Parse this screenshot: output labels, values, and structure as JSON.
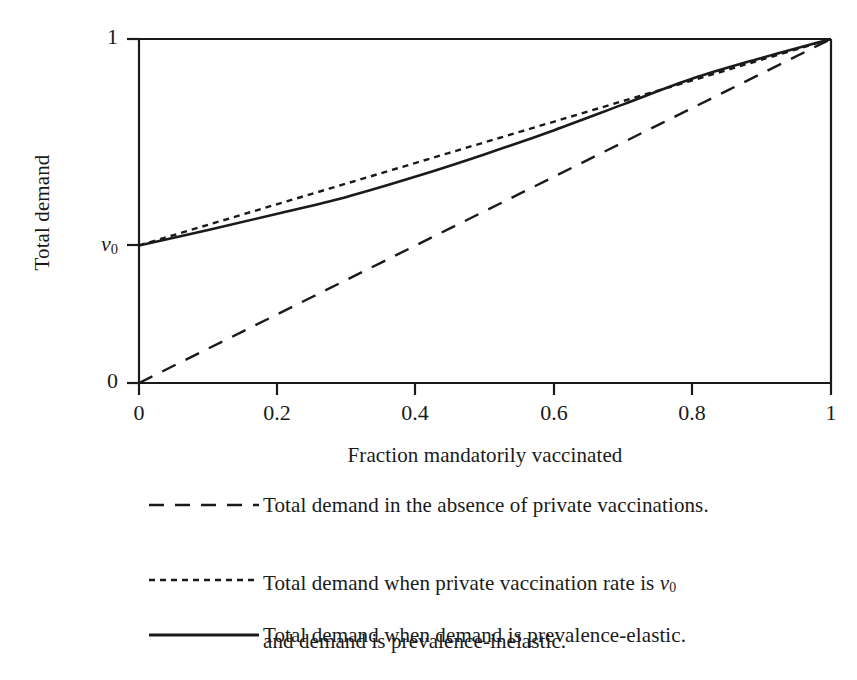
{
  "chart_data": {
    "type": "line",
    "title": "",
    "xlabel": "Fraction mandatorily vaccinated",
    "ylabel": "Total demand",
    "xlim": [
      0,
      1
    ],
    "ylim": [
      0,
      1
    ],
    "grid": false,
    "xticks": [
      0,
      0.2,
      0.4,
      0.6,
      0.8,
      1
    ],
    "xticklabels": [
      "0",
      "0.2",
      "0.4",
      "0.6",
      "0.8",
      "1"
    ],
    "yticks": [
      0,
      0.4,
      1
    ],
    "yticklabels": [
      "0",
      "v0",
      "1"
    ],
    "ytick_label_special": {
      "v0_symbol": "v",
      "v0_subscript": "0",
      "v0_value": 0.4
    },
    "legend_position": "below-axes",
    "series": [
      {
        "name": "absence",
        "label": "Total demand in the absence of private vaccinations.",
        "linestyle": "dashed",
        "color": "#1a1a1a",
        "x": [
          0,
          0.1,
          0.2,
          0.3,
          0.4,
          0.5,
          0.6,
          0.7,
          0.8,
          0.9,
          1
        ],
        "y": [
          0,
          0.1,
          0.2,
          0.3,
          0.4,
          0.5,
          0.6,
          0.7,
          0.8,
          0.9,
          1
        ]
      },
      {
        "name": "inelastic",
        "label": "Total demand when private vaccination rate is v0\nand demand is prevalence-inelastic.",
        "label_line1_pre": "Total demand when private vaccination rate is ",
        "label_line1_symbol": "v",
        "label_line1_subscript": "0",
        "label_line2": "and demand is prevalence-inelastic.",
        "linestyle": "dotted",
        "color": "#1a1a1a",
        "x": [
          0,
          0.1,
          0.2,
          0.3,
          0.4,
          0.5,
          0.6,
          0.7,
          0.8,
          0.9,
          1
        ],
        "y": [
          0.4,
          0.46,
          0.52,
          0.58,
          0.64,
          0.7,
          0.76,
          0.82,
          0.88,
          0.94,
          1
        ]
      },
      {
        "name": "elastic",
        "label": "Total demand when demand is prevalence-elastic.",
        "linestyle": "solid",
        "color": "#1a1a1a",
        "x": [
          0,
          0.1,
          0.2,
          0.3,
          0.4,
          0.5,
          0.6,
          0.7,
          0.8,
          0.9,
          1
        ],
        "y": [
          0.4,
          0.445,
          0.492,
          0.541,
          0.6,
          0.665,
          0.735,
          0.81,
          0.885,
          0.945,
          1
        ]
      }
    ]
  },
  "axes": {
    "ylabel": "Total demand",
    "xlabel": "Fraction mandatorily vaccinated",
    "ytick_top": "1",
    "ytick_bottom": "0",
    "xtick_0": "0",
    "xtick_1": "0.2",
    "xtick_2": "0.4",
    "xtick_3": "0.6",
    "xtick_4": "0.8",
    "xtick_5": "1"
  },
  "legend": {
    "entries": [
      {
        "style": "dashed",
        "text": "Total demand in the absence of private vaccinations."
      },
      {
        "style": "dotted",
        "text_line1_pre": "Total demand when private vaccination rate is ",
        "text_line1_sym": "v",
        "text_line1_sub": "0",
        "text_line2": "and demand is prevalence-inelastic."
      },
      {
        "style": "solid",
        "text": "Total demand when demand is prevalence-elastic."
      }
    ]
  },
  "colors": {
    "ink": "#1a1a1a",
    "background": "#ffffff"
  }
}
